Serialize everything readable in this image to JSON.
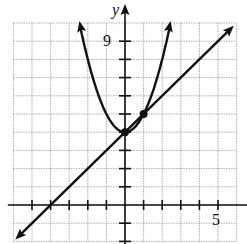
{
  "chart_data": {
    "type": "line",
    "title": "",
    "xlabel": "",
    "ylabel": "y",
    "xlim": [
      -6,
      6
    ],
    "ylim": [
      -2,
      10
    ],
    "grid": true,
    "tick_labels": {
      "x": [
        "5"
      ],
      "y": [
        "9"
      ]
    },
    "series": [
      {
        "name": "parabola",
        "equation": "y = x^2 + 4",
        "x": [
          -2.5,
          -2,
          -1,
          0,
          1,
          2,
          2.45
        ],
        "y": [
          10.25,
          8,
          5,
          4,
          5,
          8,
          10
        ]
      },
      {
        "name": "line",
        "equation": "y = x + 4",
        "x": [
          -5.9,
          -4,
          0,
          1,
          5.8
        ],
        "y": [
          -1.9,
          0,
          4,
          5,
          9.8
        ]
      }
    ],
    "points": [
      {
        "x": 0,
        "y": 4
      },
      {
        "x": 1,
        "y": 5
      }
    ]
  },
  "labels": {
    "y_axis": "y",
    "y_tick": "9",
    "x_tick": "5"
  }
}
